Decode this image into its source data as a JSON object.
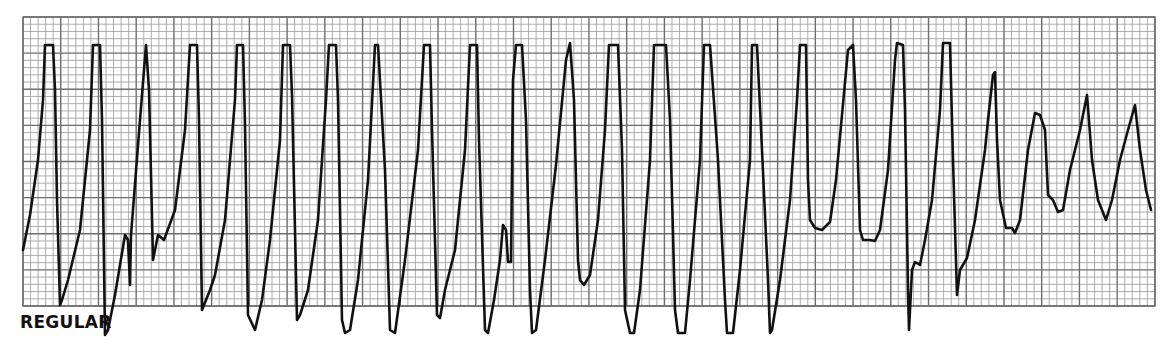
{
  "chart_data": {
    "type": "line",
    "title": "",
    "label": "REGULAR",
    "xlabel": "",
    "ylabel": "",
    "grid": true,
    "grid_spec": {
      "left": 23,
      "top": 17,
      "right": 1155,
      "bottom": 306,
      "major_x": 37.73,
      "major_y": 36.125,
      "minor_per_major": 5,
      "minor_color": "#9a9a9a",
      "major_color": "#6e6e6e"
    },
    "trace_color": "#111111",
    "points": [
      [
        23,
        250
      ],
      [
        30,
        215
      ],
      [
        38,
        160
      ],
      [
        43,
        100
      ],
      [
        45,
        45
      ],
      [
        53,
        45
      ],
      [
        55,
        90
      ],
      [
        57,
        200
      ],
      [
        60,
        305
      ],
      [
        62,
        300
      ],
      [
        68,
        280
      ],
      [
        80,
        230
      ],
      [
        90,
        130
      ],
      [
        93,
        45
      ],
      [
        100,
        45
      ],
      [
        102,
        120
      ],
      [
        105,
        335
      ],
      [
        108,
        330
      ],
      [
        115,
        295
      ],
      [
        120,
        265
      ],
      [
        125,
        235
      ],
      [
        128,
        240
      ],
      [
        130,
        285
      ],
      [
        131,
        235
      ],
      [
        140,
        120
      ],
      [
        146,
        45
      ],
      [
        149,
        90
      ],
      [
        153,
        260
      ],
      [
        158,
        235
      ],
      [
        164,
        240
      ],
      [
        175,
        210
      ],
      [
        185,
        130
      ],
      [
        190,
        45
      ],
      [
        197,
        45
      ],
      [
        199,
        120
      ],
      [
        202,
        310
      ],
      [
        210,
        290
      ],
      [
        215,
        275
      ],
      [
        225,
        220
      ],
      [
        235,
        100
      ],
      [
        237,
        45
      ],
      [
        243,
        45
      ],
      [
        245,
        125
      ],
      [
        248,
        315
      ],
      [
        255,
        330
      ],
      [
        262,
        300
      ],
      [
        270,
        240
      ],
      [
        280,
        140
      ],
      [
        283,
        45
      ],
      [
        290,
        45
      ],
      [
        292,
        95
      ],
      [
        297,
        320
      ],
      [
        300,
        315
      ],
      [
        308,
        290
      ],
      [
        318,
        220
      ],
      [
        326,
        100
      ],
      [
        329,
        45
      ],
      [
        336,
        45
      ],
      [
        338,
        100
      ],
      [
        342,
        320
      ],
      [
        345,
        333
      ],
      [
        350,
        330
      ],
      [
        358,
        280
      ],
      [
        368,
        180
      ],
      [
        375,
        45
      ],
      [
        378,
        45
      ],
      [
        385,
        170
      ],
      [
        390,
        330
      ],
      [
        395,
        333
      ],
      [
        405,
        260
      ],
      [
        418,
        150
      ],
      [
        424,
        45
      ],
      [
        430,
        45
      ],
      [
        432,
        130
      ],
      [
        437,
        315
      ],
      [
        440,
        318
      ],
      [
        445,
        290
      ],
      [
        455,
        250
      ],
      [
        465,
        150
      ],
      [
        470,
        45
      ],
      [
        477,
        45
      ],
      [
        479,
        140
      ],
      [
        485,
        330
      ],
      [
        488,
        333
      ],
      [
        494,
        300
      ],
      [
        500,
        260
      ],
      [
        503,
        225
      ],
      [
        506,
        230
      ],
      [
        508,
        262
      ],
      [
        511,
        262
      ],
      [
        513,
        80
      ],
      [
        516,
        45
      ],
      [
        522,
        45
      ],
      [
        526,
        120
      ],
      [
        530,
        290
      ],
      [
        532,
        333
      ],
      [
        536,
        330
      ],
      [
        545,
        260
      ],
      [
        556,
        165
      ],
      [
        566,
        60
      ],
      [
        570,
        43
      ],
      [
        574,
        100
      ],
      [
        578,
        260
      ],
      [
        580,
        280
      ],
      [
        584,
        285
      ],
      [
        590,
        275
      ],
      [
        598,
        220
      ],
      [
        605,
        130
      ],
      [
        609,
        45
      ],
      [
        618,
        45
      ],
      [
        622,
        150
      ],
      [
        625,
        310
      ],
      [
        630,
        333
      ],
      [
        634,
        333
      ],
      [
        640,
        290
      ],
      [
        650,
        160
      ],
      [
        654,
        45
      ],
      [
        666,
        45
      ],
      [
        670,
        120
      ],
      [
        675,
        310
      ],
      [
        678,
        333
      ],
      [
        685,
        333
      ],
      [
        690,
        280
      ],
      [
        700,
        160
      ],
      [
        704,
        45
      ],
      [
        710,
        45
      ],
      [
        718,
        160
      ],
      [
        725,
        300
      ],
      [
        727,
        333
      ],
      [
        733,
        333
      ],
      [
        740,
        270
      ],
      [
        750,
        160
      ],
      [
        752,
        45
      ],
      [
        757,
        45
      ],
      [
        762,
        150
      ],
      [
        768,
        280
      ],
      [
        770,
        333
      ],
      [
        772,
        330
      ],
      [
        780,
        280
      ],
      [
        790,
        200
      ],
      [
        797,
        100
      ],
      [
        800,
        45
      ],
      [
        806,
        45
      ],
      [
        808,
        180
      ],
      [
        810,
        220
      ],
      [
        815,
        228
      ],
      [
        822,
        230
      ],
      [
        830,
        222
      ],
      [
        836,
        180
      ],
      [
        848,
        50
      ],
      [
        853,
        45
      ],
      [
        856,
        100
      ],
      [
        860,
        230
      ],
      [
        863,
        240
      ],
      [
        870,
        240
      ],
      [
        875,
        241
      ],
      [
        880,
        230
      ],
      [
        888,
        170
      ],
      [
        895,
        60
      ],
      [
        897,
        43
      ],
      [
        903,
        45
      ],
      [
        905,
        110
      ],
      [
        908,
        290
      ],
      [
        909,
        330
      ],
      [
        912,
        270
      ],
      [
        915,
        262
      ],
      [
        920,
        265
      ],
      [
        925,
        240
      ],
      [
        932,
        200
      ],
      [
        940,
        110
      ],
      [
        943,
        43
      ],
      [
        950,
        43
      ],
      [
        953,
        160
      ],
      [
        957,
        295
      ],
      [
        960,
        270
      ],
      [
        967,
        258
      ],
      [
        975,
        220
      ],
      [
        985,
        150
      ],
      [
        988,
        120
      ],
      [
        993,
        75
      ],
      [
        995,
        72
      ],
      [
        997,
        140
      ],
      [
        1000,
        200
      ],
      [
        1006,
        228
      ],
      [
        1012,
        228
      ],
      [
        1015,
        233
      ],
      [
        1020,
        220
      ],
      [
        1028,
        150
      ],
      [
        1035,
        113
      ],
      [
        1040,
        115
      ],
      [
        1045,
        130
      ],
      [
        1048,
        195
      ],
      [
        1053,
        200
      ],
      [
        1058,
        212
      ],
      [
        1063,
        210
      ],
      [
        1070,
        170
      ],
      [
        1080,
        130
      ],
      [
        1087,
        95
      ],
      [
        1092,
        160
      ],
      [
        1098,
        200
      ],
      [
        1106,
        220
      ],
      [
        1112,
        200
      ],
      [
        1120,
        160
      ],
      [
        1128,
        130
      ],
      [
        1135,
        105
      ],
      [
        1140,
        150
      ],
      [
        1146,
        190
      ],
      [
        1151,
        210
      ]
    ],
    "complex_count": 24,
    "rhythm": "regular"
  }
}
